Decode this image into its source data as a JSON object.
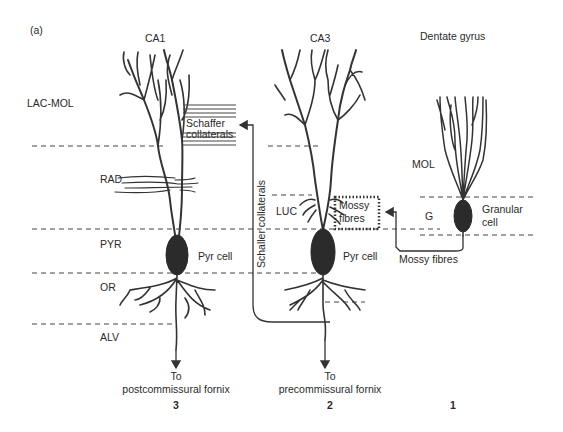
{
  "figure": {
    "panel_label": "(a)",
    "regions": {
      "ca1": {
        "title": "CA1",
        "number": "3",
        "output": [
          "To",
          "postcommissural fornix"
        ]
      },
      "ca3": {
        "title": "CA3",
        "number": "2",
        "output": [
          "To",
          "precommissural fornix"
        ]
      },
      "dg": {
        "title": "Dentate gyrus",
        "number": "1"
      }
    },
    "layers": {
      "lac_mol": "LAC-MOL",
      "rad": "RAD",
      "pyr": "PYR",
      "or": "OR",
      "alv": "ALV",
      "luc": "LUC",
      "mol": "MOL",
      "g": "G"
    },
    "cells": {
      "ca1_pyr": "Pyr cell",
      "ca3_pyr": "Pyr cell",
      "granular": [
        "Granular",
        "cell"
      ]
    },
    "pathways": {
      "schaffer_box": [
        "Schaffer",
        "collaterals"
      ],
      "schaffer_vertical": "Schaller collaterals",
      "mossy_box": [
        "Mossy",
        "fibres"
      ],
      "mossy_label": "Mossy fibres"
    },
    "colors": {
      "ink": "#2b2b2b",
      "background": "#ffffff"
    }
  }
}
